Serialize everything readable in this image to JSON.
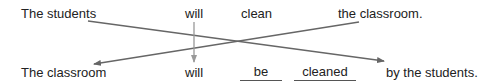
{
  "active_sentence": {
    "subject": "The students",
    "auxiliary": "will",
    "verb": "clean",
    "object": "the classroom."
  },
  "passive_sentence": {
    "subject": "The classroom",
    "auxiliary": "will",
    "blank1": "be",
    "blank2": "cleaned",
    "agent": "by the students."
  },
  "arrow_color": "#666666"
}
